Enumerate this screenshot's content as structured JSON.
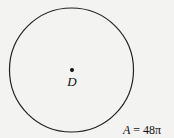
{
  "diagram": {
    "shape": "circle",
    "center_label": "D",
    "area_label": "A = 48π",
    "area_var": "A",
    "area_rest": " = 48π",
    "colors": {
      "stroke": "#222222",
      "background": "#f3f3f1"
    }
  }
}
